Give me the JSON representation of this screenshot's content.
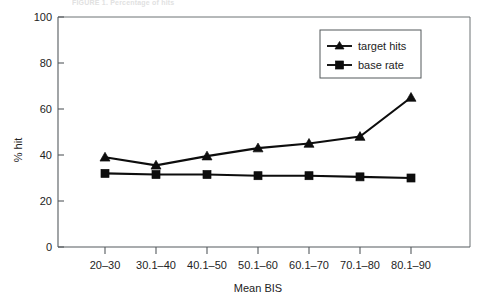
{
  "figure": {
    "faded_header_text": "FIGURE 1. Percentage of hits",
    "background_color": "#ffffff",
    "ink_color": "#0d0d0d",
    "axis_color": "#555a5e"
  },
  "chart_data": {
    "type": "line",
    "title": "",
    "xlabel": "Mean BIS",
    "ylabel": "% hit",
    "categories": [
      "20–30",
      "30.1–40",
      "40.1–50",
      "50.1–60",
      "60.1–70",
      "70.1–80",
      "80.1–90"
    ],
    "series": [
      {
        "name": "target hits",
        "marker": "triangle",
        "values": [
          39,
          35.5,
          39.5,
          43,
          45,
          48,
          65
        ]
      },
      {
        "name": "base rate",
        "marker": "square",
        "values": [
          32,
          31.5,
          31.5,
          31,
          31,
          30.5,
          30
        ]
      }
    ],
    "ylim": [
      0,
      100
    ],
    "yticks": [
      0,
      20,
      40,
      60,
      80,
      100
    ],
    "ytick_labels": [
      "0",
      "20",
      "40",
      "60",
      "80",
      "100"
    ],
    "grid": false,
    "legend_position": "top-right",
    "legend_entries": [
      "target hits",
      "base rate"
    ]
  },
  "legend": {
    "entries": [
      {
        "label": "target hits",
        "marker": "triangle-marker"
      },
      {
        "label": "base rate",
        "marker": "square-marker"
      }
    ]
  },
  "axes": {
    "y_title": "% hit",
    "x_title": "Mean BIS",
    "y_tick_labels": [
      "100",
      "80",
      "60",
      "40",
      "20",
      "0"
    ],
    "x_tick_labels": [
      "20–30",
      "30.1–40",
      "40.1–50",
      "50.1–60",
      "60.1–70",
      "70.1–80",
      "80.1–90"
    ]
  }
}
